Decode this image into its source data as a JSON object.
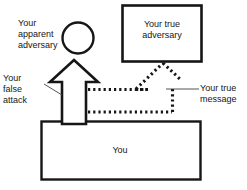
{
  "diagram": {
    "type": "block-diagram",
    "background_color": "#ffffff",
    "stroke_color": "#161616",
    "text_color": "#161616",
    "nodes": [
      {
        "id": "apparent-adversary",
        "shape": "circle",
        "label": "Your\napparent\nadversary",
        "label_position": "left-outside",
        "cx": 78,
        "cy": 38,
        "r": 16
      },
      {
        "id": "true-adversary",
        "shape": "rectangle",
        "label": "Your true\nadversary",
        "label_position": "inside",
        "x": 122,
        "y": 5,
        "width": 80,
        "height": 57
      },
      {
        "id": "you",
        "shape": "rectangle",
        "label": "You",
        "label_position": "inside",
        "x": 41,
        "y": 121,
        "width": 160,
        "height": 59
      }
    ],
    "arrows": [
      {
        "id": "false-attack",
        "style": "solid-outline",
        "label": "Your\nfalse\nattack",
        "direction": "up",
        "from": "you",
        "to": "apparent-adversary"
      },
      {
        "id": "true-message",
        "style": "dotted-outline",
        "label": "Your true\nmessage",
        "direction": "right-then-up",
        "from": "you",
        "to": "true-adversary"
      }
    ],
    "labels": {
      "apparent_adversary": "Your\napparent\nadversary",
      "false_attack": "Your\nfalse\nattack",
      "true_message": "Your true\nmessage",
      "true_adversary": "Your true\nadversary",
      "you": "You"
    }
  }
}
